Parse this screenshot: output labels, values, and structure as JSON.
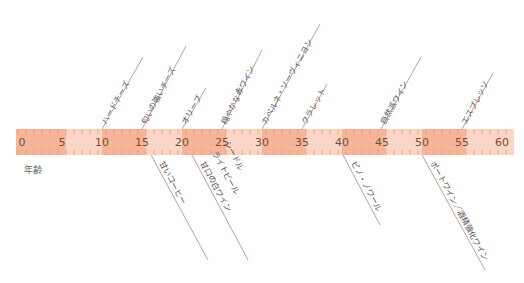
{
  "axis": {
    "title": "年齢",
    "min": 0,
    "max": 60,
    "ticks": [
      "0",
      "5",
      "10",
      "15",
      "20",
      "25",
      "30",
      "35",
      "40",
      "45",
      "50",
      "55",
      "60"
    ],
    "colors": {
      "band_dark": "#f6b598",
      "band_light": "#fbd6c6",
      "tick": "#e89a7c",
      "line": "#b5838a"
    }
  },
  "above": [
    {
      "label": "ハードチーズ",
      "age": 10
    },
    {
      "label": "匂いの強いチーズ",
      "age": 15
    },
    {
      "label": "オリーブ",
      "age": 20
    },
    {
      "label": "穏やかな赤ワイン",
      "age": 25
    },
    {
      "label": "カベルネ・ソーヴィニヨン",
      "age": 30
    },
    {
      "label": "クラレット",
      "age": 35
    },
    {
      "label": "自然派ワイン",
      "age": 45
    },
    {
      "label": "エスプレッソ",
      "age": 55
    }
  ],
  "below": [
    {
      "label": "甘いコーヒー",
      "age": 16
    },
    {
      "label": "甘口の白ワイン",
      "age": 21
    },
    {
      "label": "ライトビール",
      "age": 21
    },
    {
      "label": "シードル",
      "age": 21
    },
    {
      "label": "ピノ・ノワール",
      "age": 40
    },
    {
      "label": "ポートワイン／酒精強化ワイン",
      "age": 50
    }
  ]
}
